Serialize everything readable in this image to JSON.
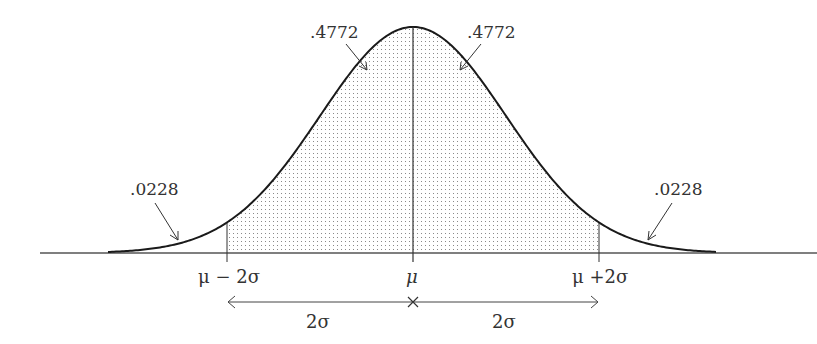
{
  "diagram": {
    "areas": {
      "left_center": ".4772",
      "right_center": ".4772",
      "left_tail": ".0228",
      "right_tail": ".0228"
    },
    "axis_labels": {
      "minus_two_sigma": "μ − 2σ",
      "mean": "μ",
      "plus_two_sigma": "μ +2σ"
    },
    "distance_labels": {
      "left": "2σ",
      "right": "2σ"
    },
    "colors": {
      "curve": "#1a1a1a",
      "axis": "#555555",
      "shade_dots": "#8a8a8a",
      "text": "#333333"
    }
  }
}
